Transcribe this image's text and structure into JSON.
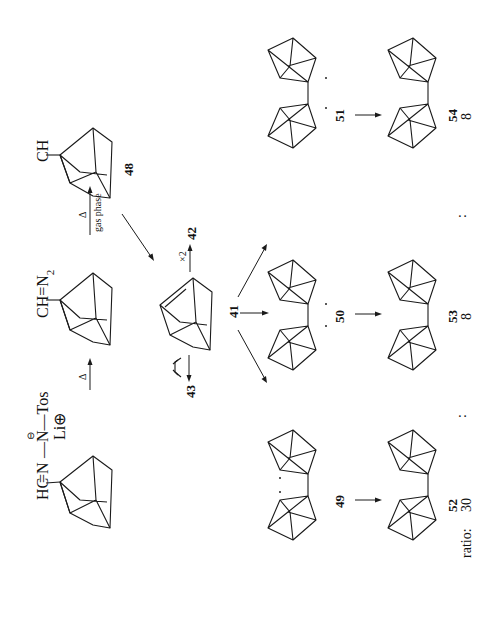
{
  "scheme": {
    "orientation": "rotated 90 degrees counterclockwise",
    "reagents": {
      "tosylhydrazone_salt": {
        "left": "HC",
        "bond1": "=N",
        "bond2": "—N—Tos",
        "charge_minus": "⊖",
        "counterion": "Li⊕"
      },
      "diazo": {
        "label": "CH=N",
        "subscript": "2"
      },
      "carbene": {
        "label": "CH",
        "number": "48"
      }
    },
    "arrows": {
      "step1": {
        "label": "Δ"
      },
      "step2": {
        "label_top": "Δ",
        "label_bottom": "gas phase"
      },
      "dimerize": {
        "label": "×2",
        "product": "42"
      },
      "trap": {
        "reagent": "1,3-butadiene",
        "product": "43"
      }
    },
    "intermediates": {
      "alkene": {
        "number": "41"
      },
      "diradical_a": {
        "number": "49"
      },
      "diradical_b": {
        "number": "50"
      },
      "diradical_c": {
        "number": "51"
      }
    },
    "products": [
      {
        "number": "52",
        "ratio": "30"
      },
      {
        "number": "53",
        "ratio": "8"
      },
      {
        "number": "54",
        "ratio": "8"
      }
    ],
    "ratio_label": "ratio:",
    "ratio_separator": ":"
  }
}
